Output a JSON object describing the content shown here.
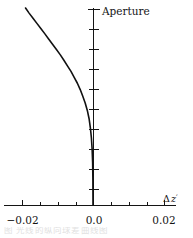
{
  "figure": {
    "aperture_label": "Aperture",
    "caption_fragment": "图  光线的纵向球差曲线图"
  },
  "chart_data": {
    "type": "line",
    "title": "",
    "subtitle": "",
    "xlabel": "Δ z′",
    "ylabel": "Aperture",
    "xlabel_parts": {
      "delta": "Δ",
      "variable": "z",
      "prime": "′"
    },
    "xlim": [
      -0.028,
      0.028
    ],
    "ylim": [
      0,
      1.08
    ],
    "grid": false,
    "legend": "none",
    "x_ticks_major": [
      -0.02,
      0.0,
      0.02
    ],
    "x_tick_labels": [
      "−0.02",
      "0.0",
      "0.02"
    ],
    "x_ticks_minor": [
      -0.015,
      -0.01,
      -0.005,
      0.005,
      0.01,
      0.015,
      0.025
    ],
    "y_ticks_major": [
      0.1,
      0.2,
      0.3,
      0.4,
      0.5,
      0.6,
      0.7,
      0.8,
      0.9,
      1.0
    ],
    "y_tick_labels": [],
    "series": [
      {
        "name": "longitudinal aberration",
        "x": [
          -0.019,
          -0.018,
          -0.0169,
          -0.0158,
          -0.0147,
          -0.0136,
          -0.0125,
          -0.0114,
          -0.0103,
          -0.0092,
          -0.0082,
          -0.0072,
          -0.0062,
          -0.0053,
          -0.0044,
          -0.0036,
          -0.0029,
          -0.0022,
          -0.0016,
          -0.0011,
          -0.00074,
          -0.00045,
          -0.00024,
          -0.0001,
          -3e-05,
          0.0
        ],
        "y": [
          1.0,
          0.974,
          0.948,
          0.922,
          0.896,
          0.87,
          0.843,
          0.816,
          0.789,
          0.762,
          0.735,
          0.706,
          0.678,
          0.648,
          0.618,
          0.586,
          0.553,
          0.518,
          0.48,
          0.438,
          0.392,
          0.34,
          0.281,
          0.215,
          0.125,
          0.0
        ]
      }
    ],
    "annotations": [
      {
        "text": "Aperture",
        "x": 0.004,
        "y": 1.02
      }
    ]
  },
  "geometry": {
    "axis_x_px": 93,
    "axis_y_px": 205,
    "plot_top_px": 8,
    "x_px_per_unit": 3550
  }
}
